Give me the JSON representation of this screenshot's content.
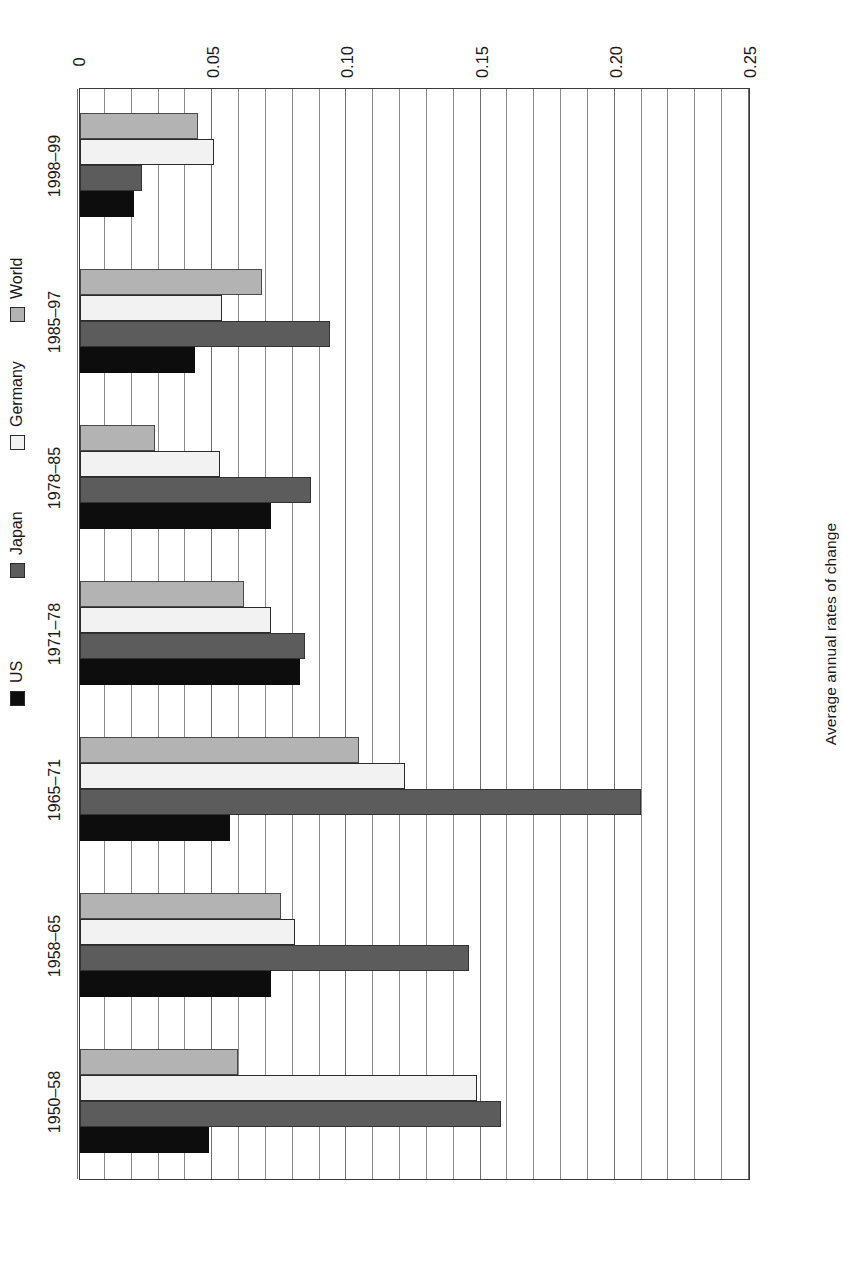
{
  "chart_data": {
    "type": "bar",
    "orientation": "horizontal",
    "title": "",
    "subtitle": "",
    "xlabel": "",
    "ylabel": "Average annual rates of change",
    "value_axis_label": "Average annual rates of change",
    "categories": [
      "1950–58",
      "1958–65",
      "1965–71",
      "1971–78",
      "1978–85",
      "1985–97",
      "1998–99"
    ],
    "tick_labels": [
      "0",
      "0.05",
      "0.10",
      "0.15",
      "0.20",
      "0.25"
    ],
    "tick_values": [
      0,
      0.05,
      0.1,
      0.15,
      0.2,
      0.25
    ],
    "axis_min": 0,
    "axis_max": 0.25,
    "minor_tick_step": 0.01,
    "grid": true,
    "grid_axis": "value",
    "legend_position": "bottom",
    "series": [
      {
        "name": "US",
        "color": "#0d0d0d",
        "values": [
          0.048,
          0.071,
          0.056,
          0.082,
          0.071,
          0.043,
          0.02
        ]
      },
      {
        "name": "Japan",
        "color": "#5c5c5c",
        "values": [
          0.157,
          0.145,
          0.209,
          0.084,
          0.086,
          0.093,
          0.023
        ]
      },
      {
        "name": "Germany",
        "color": "#f2f2f2",
        "values": [
          0.148,
          0.08,
          0.121,
          0.071,
          0.052,
          0.053,
          0.05
        ]
      },
      {
        "name": "World",
        "color": "#b3b3b3",
        "values": [
          0.059,
          0.075,
          0.104,
          0.061,
          0.028,
          0.068,
          0.044
        ]
      }
    ]
  },
  "legend": {
    "items": [
      {
        "label": "US",
        "swatch": "sw-us"
      },
      {
        "label": "Japan",
        "swatch": "sw-japan"
      },
      {
        "label": "Germany",
        "swatch": "sw-germany"
      },
      {
        "label": "World",
        "swatch": "sw-world"
      }
    ]
  },
  "axis": {
    "value_title": "Average annual rates of change"
  }
}
